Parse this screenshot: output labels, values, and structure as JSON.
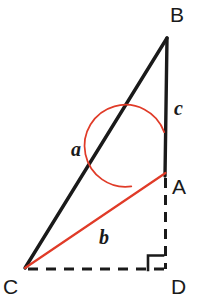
{
  "figure": {
    "type": "geometry-diagram",
    "background_color": "#ffffff",
    "stroke_color": "#1a1a1a",
    "accent_color": "#e03b28",
    "canvas": {
      "width": 203,
      "height": 300
    },
    "vertices": [
      {
        "id": "B",
        "label": "B",
        "x": 167,
        "y": 38,
        "label_x": 170,
        "label_y": 4
      },
      {
        "id": "A",
        "label": "A",
        "x": 165,
        "y": 173,
        "label_x": 172,
        "label_y": 176
      },
      {
        "id": "C",
        "label": "C",
        "x": 25,
        "y": 268,
        "label_x": 3,
        "label_y": 276
      },
      {
        "id": "D",
        "label": "D",
        "x": 166,
        "y": 269,
        "label_x": 171,
        "label_y": 276
      }
    ],
    "segments": [
      {
        "id": "BC",
        "label": "a",
        "from": "B",
        "to": "C",
        "style": "solid",
        "color": "#1a1a1a",
        "width": 3.2
      },
      {
        "id": "BA",
        "label": "c",
        "from": "B",
        "to": "A",
        "style": "solid",
        "color": "#1a1a1a",
        "width": 3.2
      },
      {
        "id": "CA",
        "label": "b",
        "from": "C",
        "to": "A",
        "style": "solid",
        "color": "#e03b28",
        "width": 2.2
      },
      {
        "id": "AD",
        "label": "",
        "from": "A",
        "to": "D",
        "style": "dashed",
        "color": "#1a1a1a",
        "width": 3.0
      },
      {
        "id": "CD",
        "label": "",
        "from": "C",
        "to": "D",
        "style": "dashed",
        "color": "#1a1a1a",
        "width": 3.0
      }
    ],
    "side_labels": [
      {
        "id": "a",
        "text": "a",
        "x": 71,
        "y": 139,
        "for_segment": "BC"
      },
      {
        "id": "b",
        "text": "b",
        "x": 99,
        "y": 227,
        "for_segment": "CA"
      },
      {
        "id": "c",
        "text": "c",
        "x": 174,
        "y": 98,
        "for_segment": "BA"
      }
    ],
    "angle_arc": {
      "id": "angle-BAC",
      "vertex": "A",
      "center_x": 165,
      "center_y": 173,
      "radius": 41,
      "color": "#e03b28",
      "width": 1.6,
      "start_x": 164,
      "start_y": 132,
      "end_x": 134,
      "end_y": 186
    },
    "right_angle_marker": {
      "id": "right-angle-D",
      "at_vertex": "D",
      "x": 148,
      "y": 255,
      "size": 15,
      "color": "#1a1a1a",
      "width": 2.6
    }
  }
}
